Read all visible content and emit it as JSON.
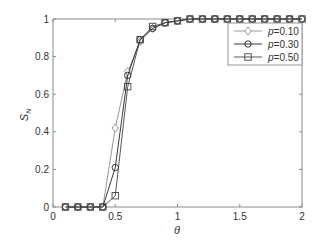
{
  "chart_data": {
    "type": "line",
    "title": "",
    "xlabel": "θ",
    "ylabel": "S_N",
    "xlim": [
      0,
      2
    ],
    "ylim": [
      0,
      1
    ],
    "xticks": [
      0,
      0.5,
      1,
      1.5,
      2
    ],
    "xtick_labels": [
      "0",
      "0.5",
      "1",
      "1.5",
      "2"
    ],
    "yticks": [
      0,
      0.2,
      0.4,
      0.6,
      0.8,
      1
    ],
    "ytick_labels": [
      "0",
      "0.2",
      "0.4",
      "0.6",
      "0.8",
      "1"
    ],
    "grid": false,
    "legend_position": "upper right",
    "x": [
      0.1,
      0.2,
      0.3,
      0.4,
      0.5,
      0.6,
      0.7,
      0.8,
      0.9,
      1.0,
      1.1,
      1.2,
      1.3,
      1.4,
      1.5,
      1.6,
      1.7,
      1.8,
      1.9,
      2.0
    ],
    "series": [
      {
        "name": "p=0.10",
        "label_var": "p",
        "label_val": "=0.10",
        "marker": "diamond",
        "color": "#8a8a8a",
        "values": [
          0,
          0,
          0,
          0,
          0.42,
          0.72,
          0.88,
          0.95,
          0.98,
          0.99,
          1,
          1,
          1,
          1,
          1,
          1,
          1,
          1,
          1,
          1
        ]
      },
      {
        "name": "p=0.30",
        "label_var": "p",
        "label_val": "=0.30",
        "marker": "circle",
        "color": "#222222",
        "values": [
          0,
          0,
          0,
          0,
          0.21,
          0.7,
          0.89,
          0.95,
          0.98,
          0.99,
          1,
          1,
          1,
          1,
          1,
          1,
          1,
          1,
          1,
          1
        ]
      },
      {
        "name": "p=0.50",
        "label_var": "p",
        "label_val": "=0.50",
        "marker": "square",
        "color": "#444444",
        "values": [
          0,
          0,
          0,
          0,
          0.06,
          0.64,
          0.89,
          0.96,
          0.98,
          0.99,
          1,
          1,
          1,
          1,
          1,
          1,
          1,
          1,
          1,
          1
        ]
      }
    ]
  }
}
